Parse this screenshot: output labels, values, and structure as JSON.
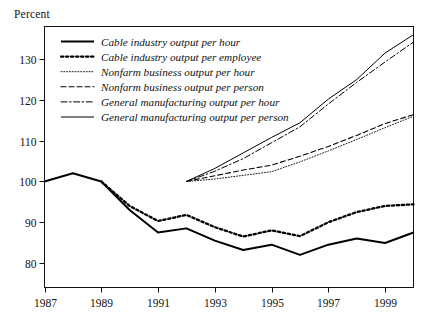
{
  "figure": {
    "y_axis_unit_label": "Percent"
  },
  "chart_data": {
    "type": "line",
    "title": "",
    "subtitle": "",
    "xlabel": "",
    "ylabel": "Percent",
    "xlim": [
      1987,
      2000
    ],
    "ylim": [
      74,
      138
    ],
    "grid": false,
    "legend_position": "top-left inside plot",
    "x_tick_labels": [
      "1987",
      "1989",
      "1991",
      "1993",
      "1995",
      "1997",
      "1999"
    ],
    "x_ticks": [
      1987,
      1989,
      1991,
      1993,
      1995,
      1997,
      1999
    ],
    "y_tick_labels": [
      "80",
      "90",
      "100",
      "110",
      "120",
      "130"
    ],
    "y_ticks": [
      80,
      90,
      100,
      110,
      120,
      130
    ],
    "series": [
      {
        "name": "Cable industry output per hour",
        "style": "solid-thick",
        "color": "#000000",
        "x": [
          1987,
          1988,
          1989,
          1990,
          1991,
          1992,
          1993,
          1994,
          1995,
          1996,
          1997,
          1998,
          1999,
          2000
        ],
        "values": [
          100.0,
          102.0,
          100.0,
          93.0,
          87.5,
          88.5,
          85.5,
          83.2,
          84.5,
          82.0,
          84.5,
          86.0,
          84.9,
          87.5
        ]
      },
      {
        "name": "Cable industry output per employee",
        "style": "dotted-thick",
        "color": "#000000",
        "x": [
          1989,
          1990,
          1991,
          1992,
          1993,
          1994,
          1995,
          1996,
          1997,
          1998,
          1999,
          2000
        ],
        "values": [
          100.0,
          94.0,
          90.3,
          91.8,
          88.8,
          86.5,
          88.0,
          86.6,
          90.0,
          92.5,
          94.0,
          94.4
        ]
      },
      {
        "name": "Nonfarm business output per hour",
        "style": "dotted-fine",
        "color": "#000000",
        "x": [
          1992,
          1993,
          1994,
          1995,
          1996,
          1997,
          1998,
          1999,
          2000
        ],
        "values": [
          100.0,
          100.6,
          101.5,
          102.4,
          104.8,
          107.5,
          110.3,
          113.2,
          116.0
        ]
      },
      {
        "name": "Nonfarm business output per person",
        "style": "dashed",
        "color": "#000000",
        "x": [
          1992,
          1993,
          1994,
          1995,
          1996,
          1997,
          1998,
          1999,
          2000
        ],
        "values": [
          100.0,
          101.4,
          102.8,
          104.0,
          106.2,
          108.6,
          111.3,
          114.2,
          116.4
        ]
      },
      {
        "name": "General manufacturing output per hour",
        "style": "dash-dot",
        "color": "#000000",
        "x": [
          1992,
          1993,
          1994,
          1995,
          1996,
          1997,
          1998,
          1999,
          2000
        ],
        "values": [
          100.0,
          102.5,
          105.6,
          109.5,
          113.4,
          119.0,
          124.3,
          129.3,
          134.2
        ]
      },
      {
        "name": "General manufacturing output per person",
        "style": "solid-thin",
        "color": "#000000",
        "x": [
          1992,
          1993,
          1994,
          1995,
          1996,
          1997,
          1998,
          1999,
          2000
        ],
        "values": [
          100.0,
          103.2,
          107.0,
          110.8,
          114.4,
          120.2,
          125.0,
          131.5,
          136.0
        ]
      }
    ],
    "legend": [
      "Cable industry output per hour",
      "Cable industry output per employee",
      "Nonfarm business output per hour",
      "Nonfarm business output per person",
      "General manufacturing output per hour",
      "General manufacturing output per person"
    ]
  }
}
